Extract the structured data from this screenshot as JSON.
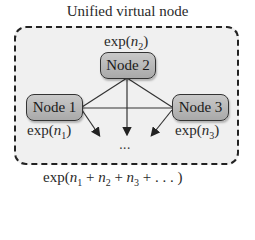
{
  "diagram": {
    "title": "Unified virtual node",
    "nodes": [
      {
        "id": "node1",
        "label": "Node 1",
        "prob_fn": "exp",
        "prob_var": "n",
        "prob_sub": "1"
      },
      {
        "id": "node2",
        "label": "Node 2",
        "prob_fn": "exp",
        "prob_var": "n",
        "prob_sub": "2"
      },
      {
        "id": "node3",
        "label": "Node 3",
        "prob_fn": "exp",
        "prob_var": "n",
        "prob_sub": "3"
      }
    ],
    "edges": [
      {
        "from": "node2",
        "to": "node1",
        "type": "line"
      },
      {
        "from": "node2",
        "to": "node3",
        "type": "line"
      },
      {
        "from": "node1",
        "to": "node3",
        "type": "line"
      },
      {
        "from": "node1",
        "to": "more",
        "type": "arrow"
      },
      {
        "from": "node2",
        "to": "more",
        "type": "arrow"
      },
      {
        "from": "node3",
        "to": "more",
        "type": "arrow"
      }
    ],
    "ellipsis": "...",
    "combined_label": "exp(n1 + n2 + n3 + ...)",
    "combined_label_parts": {
      "fn": "exp(",
      "t1": "n",
      "s1": "1",
      "plus": " + ",
      "t2": "n",
      "s2": "2",
      "t3": "n",
      "s3": "3",
      "tail": " + . . . )"
    },
    "colors": {
      "node_fill": "#b5b5b5",
      "container_fill": "#f0f0f0",
      "border": "#222222"
    }
  }
}
